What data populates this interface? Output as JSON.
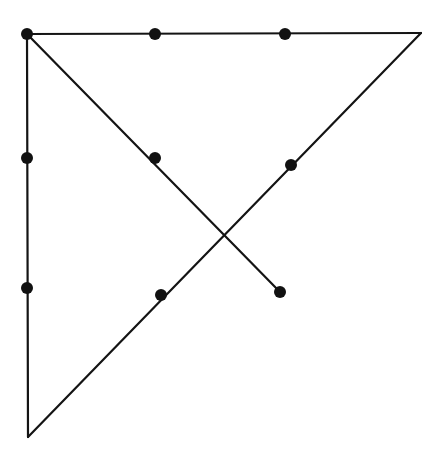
{
  "canvas": {
    "width": 441,
    "height": 467,
    "background_color": "#ffffff",
    "description": "Geometric line drawing of a right triangle with an additional crossing segment and eight marked points"
  },
  "style": {
    "line_color": "#141414",
    "line_width": 2.2,
    "dot_color": "#111111",
    "dot_radius": 6
  },
  "chart_data": {
    "type": "scatter",
    "title": "",
    "subtitle": "",
    "xlabel": "",
    "ylabel": "",
    "grid": false,
    "legend": false,
    "xlim": [
      0,
      441
    ],
    "ylim": [
      0,
      467
    ],
    "points": [
      {
        "name": "top-left-corner",
        "x": 27,
        "y": 34,
        "marked": true
      },
      {
        "name": "top-edge-midpoint",
        "x": 155,
        "y": 34,
        "marked": true
      },
      {
        "name": "top-edge-right-point",
        "x": 285,
        "y": 34,
        "marked": true
      },
      {
        "name": "top-right-corner",
        "x": 421,
        "y": 33,
        "marked": false
      },
      {
        "name": "left-edge-upper-point",
        "x": 27,
        "y": 158,
        "marked": true
      },
      {
        "name": "left-edge-lower-point",
        "x": 27,
        "y": 288,
        "marked": true
      },
      {
        "name": "bottom-left-apex",
        "x": 28,
        "y": 437,
        "marked": false
      },
      {
        "name": "descending-diagonal-mid",
        "x": 155,
        "y": 158,
        "marked": true
      },
      {
        "name": "descending-diagonal-end",
        "x": 280,
        "y": 292,
        "marked": true
      },
      {
        "name": "hypotenuse-upper-point",
        "x": 291,
        "y": 165,
        "marked": true
      },
      {
        "name": "hypotenuse-lower-point",
        "x": 161,
        "y": 295,
        "marked": true
      },
      {
        "name": "diagonal-crossing-point",
        "x": 227,
        "y": 238,
        "marked": false
      }
    ],
    "segments": [
      {
        "name": "top-edge",
        "x1": 27,
        "y1": 34,
        "x2": 421,
        "y2": 33
      },
      {
        "name": "left-edge",
        "x1": 27,
        "y1": 34,
        "x2": 28,
        "y2": 437
      },
      {
        "name": "hypotenuse",
        "x1": 28,
        "y1": 437,
        "x2": 421,
        "y2": 33
      },
      {
        "name": "descending-diagonal",
        "x1": 27,
        "y1": 34,
        "x2": 280,
        "y2": 292
      }
    ]
  }
}
